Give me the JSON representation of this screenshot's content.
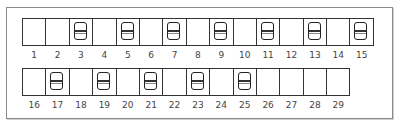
{
  "diagram": {
    "type": "switch-position-grid",
    "rows": [
      {
        "cells": [
          {
            "number": "1",
            "switch": false
          },
          {
            "number": "2",
            "switch": false
          },
          {
            "number": "3",
            "switch": true
          },
          {
            "number": "4",
            "switch": false
          },
          {
            "number": "5",
            "switch": true
          },
          {
            "number": "6",
            "switch": false
          },
          {
            "number": "7",
            "switch": true
          },
          {
            "number": "8",
            "switch": false
          },
          {
            "number": "9",
            "switch": true
          },
          {
            "number": "10",
            "switch": false
          },
          {
            "number": "11",
            "switch": true
          },
          {
            "number": "12",
            "switch": false
          },
          {
            "number": "13",
            "switch": true
          },
          {
            "number": "14",
            "switch": false
          },
          {
            "number": "15",
            "switch": true
          }
        ]
      },
      {
        "cells": [
          {
            "number": "16",
            "switch": false
          },
          {
            "number": "17",
            "switch": true
          },
          {
            "number": "18",
            "switch": false
          },
          {
            "number": "19",
            "switch": true
          },
          {
            "number": "20",
            "switch": false
          },
          {
            "number": "21",
            "switch": true
          },
          {
            "number": "22",
            "switch": false
          },
          {
            "number": "23",
            "switch": true
          },
          {
            "number": "24",
            "switch": false
          },
          {
            "number": "25",
            "switch": true
          },
          {
            "number": "26",
            "switch": false
          },
          {
            "number": "27",
            "switch": false
          },
          {
            "number": "28",
            "switch": false
          },
          {
            "number": "29",
            "switch": false
          }
        ]
      }
    ],
    "colors": {
      "border": "#333333",
      "frame": "#8a8a8a",
      "label": "#444444"
    }
  }
}
